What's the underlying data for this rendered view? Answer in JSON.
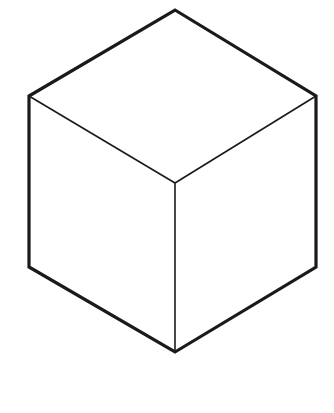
{
  "figure": {
    "subtitle": "Isometric wireframe cube (Necker cube style)",
    "type": "line-drawing",
    "canvas": {
      "width": 334,
      "height": 413,
      "background_color": "#ffffff"
    },
    "style": {
      "line_color": "#1a1a1a",
      "outer_stroke_width": 3.2,
      "inner_stroke_width": 1.6,
      "face_fill_color": "#ffffff"
    },
    "vertices": {
      "top": {
        "x": 175,
        "y": 10
      },
      "upper_right": {
        "x": 316,
        "y": 96
      },
      "lower_right": {
        "x": 316,
        "y": 267
      },
      "bottom": {
        "x": 175,
        "y": 352
      },
      "lower_left": {
        "x": 29,
        "y": 267
      },
      "upper_left": {
        "x": 29,
        "y": 96
      },
      "center": {
        "x": 175,
        "y": 183
      }
    },
    "outer_silhouette": {
      "name": "hexagon-outline",
      "points": "175,10 316,96 316,267 175,352 29,267 29,96"
    },
    "faces": [
      {
        "name": "top-face",
        "points": "175,10 316,96 175,183 29,96"
      },
      {
        "name": "left-face",
        "points": "29,96 175,183 175,352 29,267"
      },
      {
        "name": "right-face",
        "points": "175,183 316,96 316,267 175,352"
      }
    ],
    "inner_edges": [
      {
        "name": "center-to-upper-left",
        "x1": 29,
        "y1": 96,
        "x2": 175,
        "y2": 183
      },
      {
        "name": "center-to-upper-right",
        "x1": 316,
        "y1": 96,
        "x2": 175,
        "y2": 183
      },
      {
        "name": "center-to-bottom",
        "x1": 175,
        "y1": 183,
        "x2": 175,
        "y2": 352
      }
    ]
  }
}
